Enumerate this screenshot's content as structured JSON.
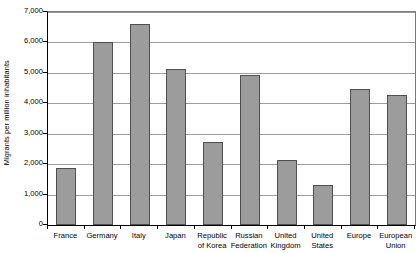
{
  "chart_data": {
    "type": "bar",
    "title": "",
    "subtitle": "",
    "xlabel": "",
    "ylabel": "Migrants per million inhabitants",
    "ylim": [
      0,
      7000
    ],
    "ytick_values": [
      0,
      1000,
      2000,
      3000,
      4000,
      5000,
      6000,
      7000
    ],
    "ytick_labels": [
      "0",
      "1,000",
      "2,000",
      "3,000",
      "4,000",
      "5,000",
      "6,000",
      "7,000"
    ],
    "grid": "horizontal",
    "legend": "none",
    "bar_fill_color": "#9c9c9c",
    "bar_border_color": "#4f4f4f",
    "gridline_color": "#9d9d9d",
    "axis_color": "#000000",
    "categories": [
      "France",
      "Germany",
      "Italy",
      "Japan",
      "Republic of Korea",
      "Russian Federation",
      "United Kingdom",
      "United States",
      "Europe",
      "European Union"
    ],
    "category_label_lines": [
      [
        "France"
      ],
      [
        "Germany"
      ],
      [
        "Italy"
      ],
      [
        "Japan"
      ],
      [
        "Republic",
        "of Korea"
      ],
      [
        "Russian",
        "Federation"
      ],
      [
        "United",
        "Kingdom"
      ],
      [
        "United",
        "States"
      ],
      [
        "Europe"
      ],
      [
        "European",
        "Union"
      ]
    ],
    "values": [
      1880,
      6030,
      6600,
      5140,
      2735,
      4940,
      2140,
      1320,
      4480,
      4285
    ]
  }
}
